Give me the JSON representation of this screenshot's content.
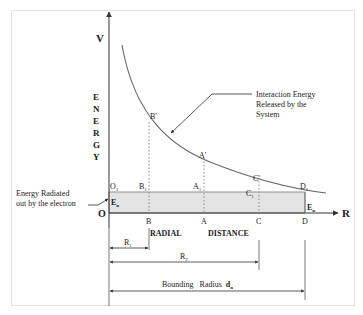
{
  "diagram": {
    "y_axis": {
      "symbol": "V",
      "label_letters": [
        "E",
        "N",
        "E",
        "R",
        "G",
        "Y"
      ]
    },
    "x_axis": {
      "symbol": "R",
      "label_left": "RADIAL",
      "label_right": "DISTANCE"
    },
    "origin": "O",
    "curve_annotation": [
      "Interaction Energy",
      "Released by  the",
      "System"
    ],
    "radiated_annotation": [
      "Energy  Radiated",
      "out by the electron"
    ],
    "baseline_labels": {
      "left": "E",
      "left_sub": "n",
      "right": "E",
      "right_sub": "n"
    },
    "points_top": [
      "B'",
      "A'",
      "C'"
    ],
    "points_mid": {
      "O1": "O",
      "B1": "B",
      "A1": "A",
      "C1": "C",
      "D1": "D",
      "sub": "1"
    },
    "points_axis": [
      "B",
      "A",
      "C",
      "D"
    ],
    "dimensions": {
      "r1": {
        "label": "R",
        "sub": "1"
      },
      "r2": {
        "label": "R",
        "sub": "2"
      },
      "bounding": {
        "label": "Bounding   Radius",
        "symbol": "d",
        "sub": "n"
      }
    },
    "colors": {
      "shade": "#e4e4e4",
      "line": "#555555"
    }
  }
}
